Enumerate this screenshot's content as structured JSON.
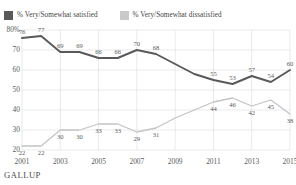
{
  "legend": {
    "entries": [
      {
        "label": "% Very/Somewhat satisfied",
        "swatch": "legend-swatch-satisfied",
        "color": "#59595b"
      },
      {
        "label": "% Very/Somewhat dissatisfied",
        "swatch": "legend-swatch-dissatisfied",
        "color": "#c9c9cb"
      }
    ]
  },
  "axis": {
    "y_ticks": [
      "80%",
      "70",
      "60",
      "50",
      "40",
      "30",
      "20"
    ],
    "x_ticks": [
      "2001",
      "2003",
      "2005",
      "2007",
      "2009",
      "2011",
      "2013",
      "2015"
    ]
  },
  "footer": {
    "brand": "GALLUP"
  },
  "chart_data": {
    "type": "line",
    "title": "",
    "subtitle": "",
    "xlabel": "",
    "ylabel": "",
    "ylim": [
      20,
      80
    ],
    "xlim": [
      2001,
      2015
    ],
    "grid": true,
    "legend_position": "top-left",
    "x": [
      2001,
      2002,
      2003,
      2004,
      2005,
      2006,
      2007,
      2008,
      2009,
      2010,
      2011,
      2012,
      2013,
      2014,
      2015
    ],
    "categories": [
      "2001",
      "2002",
      "2003",
      "2004",
      "2005",
      "2006",
      "2007",
      "2008",
      "2009",
      "2010",
      "2011",
      "2012",
      "2013",
      "2014",
      "2015"
    ],
    "series": [
      {
        "name": "% Very/Somewhat satisfied",
        "color": "#59595b",
        "values": [
          76,
          77,
          69,
          69,
          66,
          66,
          70,
          68,
          63,
          58,
          55,
          53,
          57,
          54,
          60
        ],
        "labels": [
          "76",
          "77",
          "69",
          "69",
          "66",
          "66",
          "70",
          "68",
          "",
          "",
          "55",
          "53",
          "57",
          "54",
          "60"
        ]
      },
      {
        "name": "% Very/Somewhat dissatisfied",
        "color": "#c4c4c6",
        "values": [
          22,
          22,
          30,
          30,
          33,
          33,
          29,
          31,
          36,
          40,
          44,
          46,
          42,
          45,
          38
        ],
        "labels": [
          "22",
          "22",
          "30",
          "30",
          "33",
          "33",
          "29",
          "31",
          "",
          "",
          "44",
          "46",
          "42",
          "45",
          "38"
        ]
      }
    ]
  }
}
